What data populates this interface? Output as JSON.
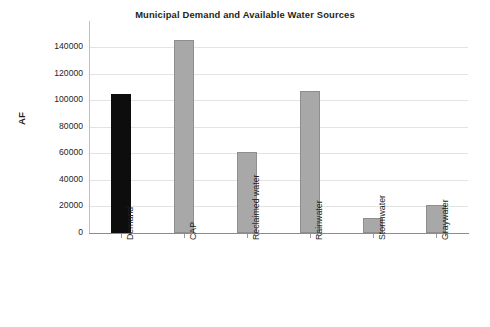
{
  "chart_data": {
    "type": "bar",
    "title": "Municipal Demand and Available Water Sources",
    "xlabel": "",
    "ylabel": "AF",
    "categories": [
      "Demand",
      "CAP",
      "Reclaimed water",
      "Rainwater",
      "Stormwater",
      "Graywater"
    ],
    "values": [
      105000,
      145000,
      61000,
      107000,
      11000,
      21000
    ],
    "ylim": [
      0,
      140000
    ],
    "ytick_values": [
      0,
      20000,
      40000,
      60000,
      80000,
      100000,
      120000,
      140000
    ],
    "ytick_labels": [
      "0",
      "20000",
      "40000",
      "60000",
      "80000",
      "100000",
      "120000",
      "140000"
    ],
    "grid": "horizontal",
    "legend": "none",
    "bar_colors": [
      "#0d0d0d",
      "#a8a8a8",
      "#a8a8a8",
      "#a8a8a8",
      "#a8a8a8",
      "#a8a8a8"
    ],
    "series": [
      {
        "name": "Water volume",
        "values": [
          105000,
          145000,
          61000,
          107000,
          11000,
          21000
        ]
      }
    ]
  },
  "colors": {
    "demand_bar": "#0d0d0d",
    "source_bar": "#a8a8a8",
    "bar_outline": "#8e8e8e",
    "gridline": "#e3e3e3",
    "axis": "#8c8c8c",
    "text": "#231f20",
    "background": "#ffffff"
  },
  "axis": {
    "y_label": "AF",
    "y_max_label": "140000",
    "y_min_label": "0"
  }
}
